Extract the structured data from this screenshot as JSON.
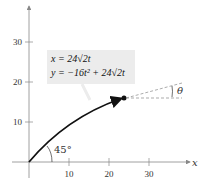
{
  "equations": {
    "line1": "x = 24√2t",
    "line2": "y = −16t² + 24√2t"
  },
  "labels": {
    "angle_launch": "45°",
    "angle_theta": "θ",
    "x_axis": "x"
  },
  "x_ticks": [
    "10",
    "20",
    "30"
  ],
  "y_ticks": [
    "10",
    "20",
    "30"
  ],
  "colors": {
    "curve": "#111111",
    "axis": "#888888",
    "box": "#ececec"
  }
}
